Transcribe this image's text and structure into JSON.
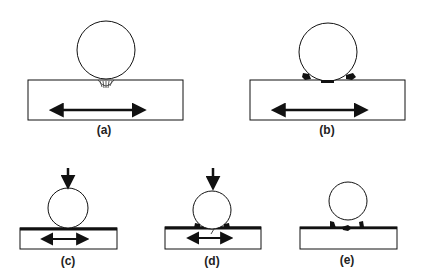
{
  "diagram": {
    "panels": [
      {
        "id": "a",
        "label": "(a)",
        "description": "Sphere resting on substrate with hatched contact region; horizontal bidirectional sliding arrow"
      },
      {
        "id": "b",
        "label": "(b)",
        "description": "Sphere on substrate with debris particles at contact edges; horizontal bidirectional sliding arrow"
      },
      {
        "id": "c",
        "label": "(c)",
        "description": "Sphere under downward normal load on coated substrate; bidirectional sliding arrow"
      },
      {
        "id": "d",
        "label": "(d)",
        "description": "Loaded sphere on coated substrate with crack beneath contact; bidirectional sliding arrow"
      },
      {
        "id": "e",
        "label": "(e)",
        "description": "Sphere lifted off coated substrate showing damaged coating debris"
      }
    ],
    "colors": {
      "stroke": "#111111",
      "background": "#ffffff"
    }
  }
}
